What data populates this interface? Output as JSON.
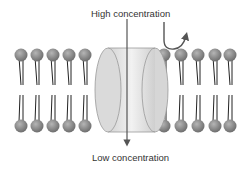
{
  "diagram": {
    "labels": {
      "top": "High concentration",
      "bottom": "Low concentration"
    },
    "elements": {
      "membrane": "phospholipid bilayer",
      "left_phospholipid_count": 5,
      "right_phospholipid_count": 5,
      "channel": "channel protein",
      "arrows": [
        "diffusion arrow through channel (down)",
        "curved arrow over membrane (blocked)"
      ]
    },
    "colors": {
      "head": "#8a8a8a",
      "tail": "#222222",
      "channel": "#dcdcdc",
      "arrow": "#555555"
    }
  }
}
